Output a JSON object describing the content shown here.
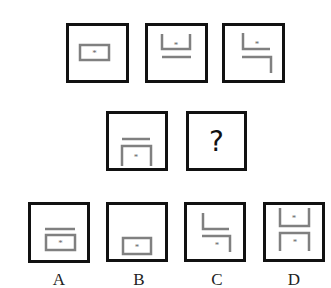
{
  "puzzle": {
    "type": "figure-sequence-reasoning",
    "stroke_color": "#808080",
    "border_color": "#111111",
    "row1": [
      {
        "id": "panel-1",
        "figure": "rectangle-with-star"
      },
      {
        "id": "panel-2",
        "figure": "u-shape-with-star-and-line-below"
      },
      {
        "id": "panel-3",
        "figure": "two-l-shapes-with-star"
      }
    ],
    "row2": [
      {
        "id": "panel-4",
        "figure": "line-above-inverted-u-with-star"
      },
      {
        "id": "panel-5",
        "figure": "question",
        "text": "?"
      }
    ],
    "options": [
      {
        "label": "A",
        "figure": "line-above-rectangle-with-star"
      },
      {
        "label": "B",
        "figure": "rectangle-with-star-low"
      },
      {
        "label": "C",
        "figure": "two-l-shapes-star-bottom"
      },
      {
        "label": "D",
        "figure": "u-and-inverted-u-with-two-stars"
      }
    ]
  }
}
